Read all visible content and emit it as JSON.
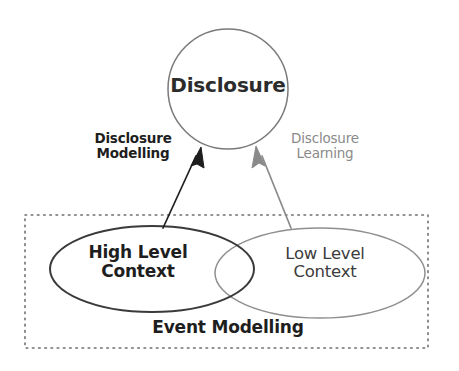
{
  "diagram": {
    "background_color": "#ffffff",
    "nodes": {
      "disclosure": {
        "label": "Disclosure",
        "shape": "circle",
        "stroke_color": "#7a7a7a",
        "text_color": "#2b2b2b"
      },
      "high_level_context": {
        "label": "High Level\nContext",
        "shape": "ellipse",
        "stroke_color": "#3a3a3a",
        "text_color": "#1e1e1e"
      },
      "low_level_context": {
        "label": "Low Level\nContext",
        "shape": "ellipse",
        "stroke_color": "#8f8f8f",
        "text_color": "#3c3c3c"
      },
      "event_modelling": {
        "label": "Event Modelling",
        "shape": "dotted-rectangle",
        "stroke_color": "#6e6e6e",
        "text_color": "#1e1e1e"
      }
    },
    "edges": [
      {
        "id": "disclosure-modelling",
        "label": "Disclosure\nModelling",
        "from": "high_level_context",
        "to": "disclosure",
        "color": "#1e1e1e",
        "label_color": "#1e1e1e",
        "label_weight": "bold",
        "arrowhead": "filled"
      },
      {
        "id": "disclosure-learning",
        "label": "Disclosure\nLearning",
        "from": "low_level_context",
        "to": "disclosure",
        "color": "#8a8a8a",
        "label_color": "#8a8a8a",
        "label_weight": "normal",
        "arrowhead": "filled"
      }
    ]
  }
}
